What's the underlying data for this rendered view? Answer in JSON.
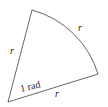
{
  "diagram": {
    "labels": {
      "left_radius": "r",
      "arc_length": "r",
      "bottom_radius": "r",
      "angle": "1 rad"
    },
    "colors": {
      "stroke": "#555555",
      "text": "#222222",
      "background": "#ffffff"
    }
  }
}
